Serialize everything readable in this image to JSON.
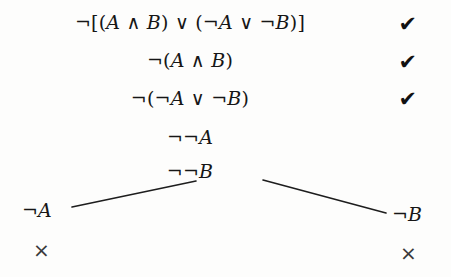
{
  "diagram": {
    "type": "truth-tree",
    "trunk": [
      {
        "text": "¬[(A ∧ B) ∨ (¬A ∨ ¬B)]",
        "check": "✔"
      },
      {
        "text": "¬(A ∧ B)",
        "check": "✔"
      },
      {
        "text": "¬(¬A ∨ ¬B)",
        "check": "✔"
      },
      {
        "text": "¬¬A",
        "check": ""
      },
      {
        "text": "¬¬B",
        "check": ""
      }
    ],
    "branches": {
      "left": {
        "label": "¬A",
        "close": "×"
      },
      "right": {
        "label": "¬B",
        "close": "×"
      }
    },
    "colors": {
      "ink": "#161616",
      "close_mark": "#3a3a3a",
      "paper": "#fdfdfc",
      "branch_line": "#1d1d1d"
    }
  }
}
